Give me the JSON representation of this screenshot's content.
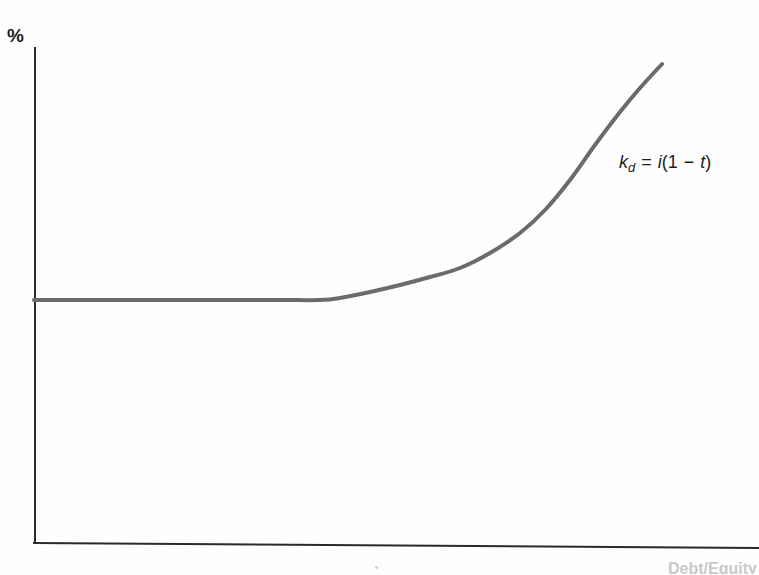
{
  "figure": {
    "background_color": "#fefefe",
    "width": 759,
    "height": 575
  },
  "axes": {
    "y_axis_label": "%",
    "x_axis_label": "",
    "line_color": "#2b2b2b",
    "line_width": 2,
    "origin": {
      "x": 34,
      "y": 543
    },
    "y_top": 48,
    "x_right": 759
  },
  "annotation": {
    "symbol": "k",
    "subscript": "d",
    "equals": "=",
    "rate": "i",
    "open_paren": "(",
    "one": "1",
    "minus": "−",
    "tax": "t",
    "close_paren": ")",
    "full_text": "k_d = i(1 − t)",
    "color": "#1d1d1d",
    "x": 619,
    "y": 150
  },
  "bottom_caption": {
    "text": "Debt/Equity",
    "visible_partially": true,
    "color": "#c9c9c9"
  },
  "chart_data": {
    "type": "line",
    "title": "",
    "subtitle": "",
    "xlabel": "",
    "ylabel": "%",
    "grid": false,
    "legend_position": "none",
    "annotations": [
      {
        "text": "k_d = i(1 − t)",
        "x": 0.86,
        "y": 0.73,
        "style": "italic"
      }
    ],
    "xlim": [
      0,
      1
    ],
    "ylim": [
      0,
      1
    ],
    "series": [
      {
        "name": "k_d = i(1 - t)",
        "color": "#6b6b6b",
        "line_width": 4,
        "description": "Cost of debt: flat at a constant rate at low leverage, then rising sharply as debt increases",
        "x": [
          0.0,
          0.05,
          0.1,
          0.15,
          0.2,
          0.25,
          0.3,
          0.35,
          0.4,
          0.45,
          0.5,
          0.55,
          0.6,
          0.65,
          0.7,
          0.75,
          0.8,
          0.85,
          0.9,
          0.95,
          1.0
        ],
        "y": [
          0.491,
          0.491,
          0.491,
          0.491,
          0.491,
          0.491,
          0.492,
          0.494,
          0.5,
          0.512,
          0.531,
          0.557,
          0.59,
          0.63,
          0.676,
          0.727,
          0.782,
          0.84,
          0.9,
          0.962,
          1.0
        ],
        "pixel_points": [
          {
            "x": 34,
            "y": 300
          },
          {
            "x": 100,
            "y": 300
          },
          {
            "x": 160,
            "y": 300
          },
          {
            "x": 220,
            "y": 300
          },
          {
            "x": 280,
            "y": 300
          },
          {
            "x": 320,
            "y": 300
          },
          {
            "x": 340,
            "y": 298
          },
          {
            "x": 370,
            "y": 292
          },
          {
            "x": 400,
            "y": 285
          },
          {
            "x": 430,
            "y": 277
          },
          {
            "x": 460,
            "y": 268
          },
          {
            "x": 490,
            "y": 253
          },
          {
            "x": 520,
            "y": 233
          },
          {
            "x": 545,
            "y": 210
          },
          {
            "x": 570,
            "y": 180
          },
          {
            "x": 595,
            "y": 145
          },
          {
            "x": 620,
            "y": 112
          },
          {
            "x": 640,
            "y": 88
          },
          {
            "x": 662,
            "y": 64
          }
        ]
      }
    ]
  }
}
